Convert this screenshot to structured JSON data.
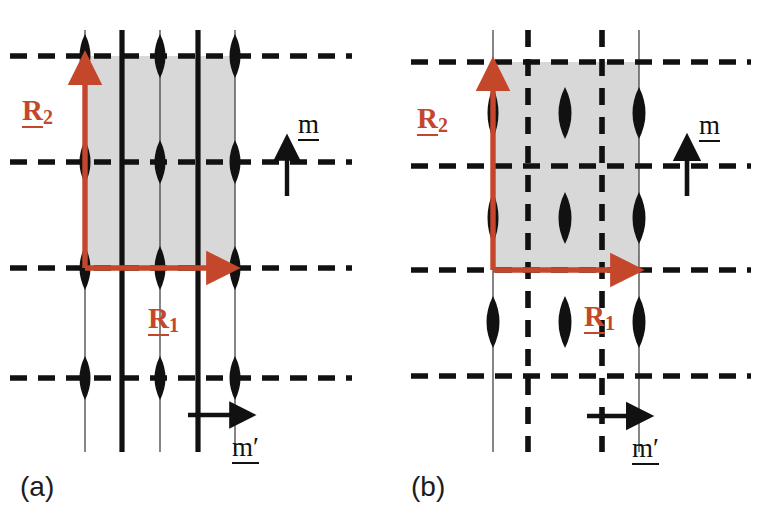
{
  "figure": {
    "kind": "crystallographic-symmetry-diagram",
    "panels": [
      {
        "id": "a",
        "caption": "(a)",
        "labels": {
          "vector_R1": "R",
          "vector_R1_sub": "1",
          "vector_R2": "R",
          "vector_R2_sub": "2",
          "mirror_m": "m",
          "mirror_m_prime": "m′"
        },
        "description": "Primitive rectangular lattice with solid vertical mirror lines m′ and dashed horizontal mirror lines m; two-fold rotation lenses sit on the horizontal mirror lines.",
        "unit_cell": {
          "shaded": true,
          "fill": "#D8D8D8",
          "x": 85,
          "y": 56,
          "width": 150,
          "height": 212
        },
        "horizontal_mirror_lines_y": [
          56,
          162,
          268,
          378
        ],
        "vertical_thin_lines_x": [
          85,
          160,
          235
        ],
        "vertical_thick_lines_x": [
          122,
          198
        ],
        "lens_columns_x": [
          85,
          160,
          235
        ],
        "lens_rows_y": [
          56,
          162,
          268,
          378
        ],
        "vectors": {
          "R1": {
            "from_x": 85,
            "from_y": 268,
            "to_x": 237,
            "to_y": 268
          },
          "R2": {
            "from_x": 85,
            "from_y": 268,
            "to_x": 85,
            "to_y": 54
          }
        },
        "m_arrow": {
          "x": 287,
          "y_from": 196,
          "y_to": 138,
          "direction": "up"
        },
        "m_prime_arrow": {
          "y": 415,
          "x_from": 190,
          "x_to": 250,
          "direction": "right"
        }
      },
      {
        "id": "b",
        "caption": "(b)",
        "labels": {
          "vector_R1": "R",
          "vector_R1_sub": "1",
          "vector_R2": "R",
          "vector_R2_sub": "2",
          "mirror_m": "m",
          "mirror_m_prime": "m′"
        },
        "description": "Centred rectangular lattice with dashed vertical glide lines m′ and dashed horizontal mirror lines m; two-fold rotation lenses sit midway between the horizontal mirror lines.",
        "unit_cell": {
          "shaded": true,
          "fill": "#D8D8D8",
          "x": 104,
          "y": 62,
          "width": 146,
          "height": 208
        },
        "horizontal_mirror_lines_y": [
          62,
          166,
          270,
          376
        ],
        "vertical_thin_lines_x": [
          104,
          250
        ],
        "vertical_dashed_lines_x": [
          139,
          213
        ],
        "lens_columns_x": [
          104,
          176,
          250
        ],
        "lens_rows_y": [
          113,
          218,
          322
        ],
        "vectors": {
          "R1": {
            "from_x": 104,
            "from_y": 270,
            "to_x": 252,
            "to_y": 270
          },
          "R2": {
            "from_x": 104,
            "from_y": 270,
            "to_x": 104,
            "to_y": 60
          }
        },
        "m_arrow": {
          "x": 298,
          "y_from": 196,
          "y_to": 140,
          "direction": "up"
        },
        "m_prime_arrow": {
          "y": 416,
          "x_from": 200,
          "x_to": 258,
          "direction": "right"
        }
      }
    ],
    "colors": {
      "vector_red": "#C4472B",
      "lattice_black": "#111111",
      "cell_gray": "#D8D8D8",
      "background": "#FFFFFF"
    }
  }
}
